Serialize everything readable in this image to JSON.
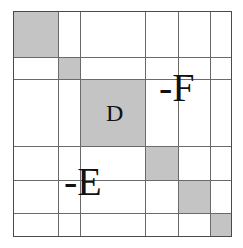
{
  "diagram": {
    "type": "block-diagonal-matrix-grid",
    "colors": {
      "shade": "#c4c4c4",
      "line": "#6a6a6a",
      "border": "#4a4a4a",
      "text": "#111111",
      "background": "#ffffff"
    },
    "grid": {
      "x": [
        14,
        58,
        80,
        145,
        178,
        210,
        231
      ],
      "y": [
        12,
        57,
        79,
        146,
        180,
        213,
        236
      ]
    },
    "shaded_blocks": [
      {
        "col": 0,
        "row": 0,
        "label": ""
      },
      {
        "col": 1,
        "row": 1,
        "label": ""
      },
      {
        "col": 2,
        "row": 2,
        "label": "D"
      },
      {
        "col": 3,
        "row": 3,
        "label": ""
      },
      {
        "col": 4,
        "row": 4,
        "label": ""
      },
      {
        "col": 5,
        "row": 5,
        "label": ""
      }
    ],
    "labels": {
      "d": "D",
      "f": "-F",
      "e": "-E"
    }
  }
}
